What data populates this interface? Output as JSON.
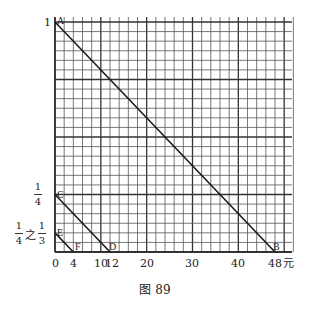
{
  "chart_data": {
    "type": "line",
    "title": "",
    "caption": "图 89",
    "xlabel": "元",
    "ylabel": "",
    "xlim": [
      0,
      52
    ],
    "ylim": [
      0,
      1
    ],
    "grid": true,
    "grid_x_step": 2,
    "grid_y_step": 0.041667,
    "x_ticks": [
      0,
      4,
      10,
      12,
      20,
      30,
      40,
      48
    ],
    "y_ticks": [
      {
        "value": 1,
        "label": "1"
      },
      {
        "value": 0.25,
        "label": "1/4"
      },
      {
        "value": 0.083333,
        "label": "1/4 之 1/3"
      }
    ],
    "series": [
      {
        "name": "AB",
        "points": [
          {
            "label": "A",
            "x": 0,
            "y": 1
          },
          {
            "label": "B",
            "x": 48,
            "y": 0
          }
        ]
      },
      {
        "name": "CD",
        "points": [
          {
            "label": "C",
            "x": 0,
            "y": 0.25
          },
          {
            "label": "D",
            "x": 12,
            "y": 0
          }
        ]
      },
      {
        "name": "EF",
        "points": [
          {
            "label": "E",
            "x": 0,
            "y": 0.083333
          },
          {
            "label": "F",
            "x": 4,
            "y": 0
          }
        ]
      }
    ]
  },
  "labels": {
    "y_one": "1",
    "y_quarter_num": "1",
    "y_quarter_den": "4",
    "y_third_a_num": "1",
    "y_third_a_den": "4",
    "y_third_of": "之",
    "y_third_b_num": "1",
    "y_third_b_den": "3",
    "x_unit": "元",
    "x0": "0",
    "x4": "4",
    "x10": "10",
    "x12": "12",
    "x20": "20",
    "x30": "30",
    "x40": "40",
    "x48": "48",
    "pA": "A",
    "pB": "B",
    "pC": "C",
    "pD": "D",
    "pE": "E",
    "pF": "F",
    "caption": "图 89"
  }
}
